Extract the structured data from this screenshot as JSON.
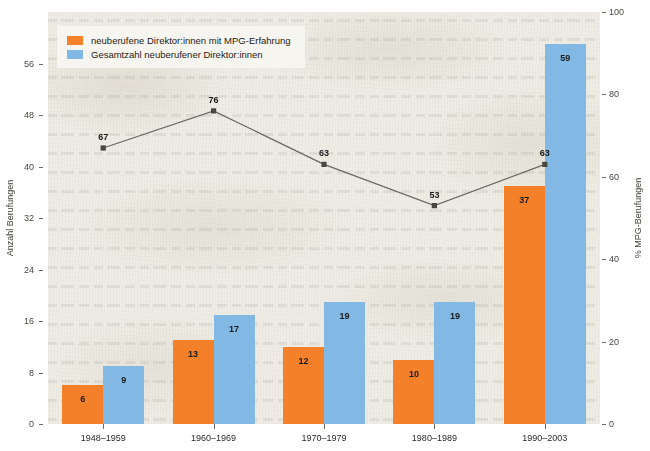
{
  "chart_data": {
    "type": "bar",
    "title": "",
    "subtitle": "",
    "categories": [
      "1948–1959",
      "1960–1969",
      "1970–1979",
      "1980–1989",
      "1990–2003"
    ],
    "series": [
      {
        "name": "neuberufene Direktor:innen mit MPG-Erfahrung",
        "type": "bar",
        "axis": "left",
        "color": "#F4802A",
        "values": [
          6,
          13,
          12,
          10,
          37
        ]
      },
      {
        "name": "Gesamtzahl neuberufener Direktor:innen",
        "type": "bar",
        "axis": "left",
        "color": "#82B9E4",
        "values": [
          9,
          17,
          19,
          19,
          59
        ]
      },
      {
        "name": "% MPG-Berufungen",
        "type": "line",
        "axis": "right",
        "color": "#6b6660",
        "values": [
          67,
          76,
          63,
          53,
          63
        ]
      }
    ],
    "xlabel": "",
    "ylabel": "Anzahl Berufungen",
    "y2label": "% MPG-Berufungen",
    "ylim": [
      0,
      64
    ],
    "y2lim": [
      0,
      100
    ],
    "yticks": [
      "0",
      "8",
      "16",
      "24",
      "32",
      "40",
      "48",
      "56"
    ],
    "ytick_values": [
      0,
      8,
      16,
      24,
      32,
      40,
      48,
      56
    ],
    "y2ticks": [
      "0",
      "20",
      "40",
      "60",
      "80",
      "100"
    ],
    "y2tick_values": [
      0,
      20,
      40,
      60,
      80,
      100
    ],
    "grid": false,
    "legend_position": "top-left",
    "plot_background": "#eeece4"
  },
  "legend": {
    "items": [
      {
        "label": "neuberufene Direktor:innen mit MPG-Erfahrung",
        "color": "#F4802A"
      },
      {
        "label": "Gesamtzahl neuberufener Direktor:innen",
        "color": "#82B9E4"
      }
    ]
  },
  "axes": {
    "left_title": "Anzahl Berufungen",
    "right_title": "% MPG-Berufungen"
  }
}
